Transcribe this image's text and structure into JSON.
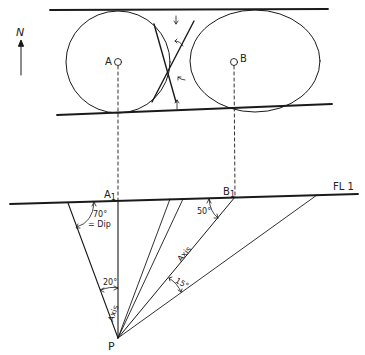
{
  "diagram": {
    "type": "structural-geology-fold-construction",
    "north_label": "N",
    "points": {
      "A": "A",
      "B": "B",
      "A1": "A",
      "A1_sub": "1",
      "B1": "B",
      "B1_sub": "1",
      "P": "P"
    },
    "fold_line_label": "FL 1",
    "angles": {
      "dip": "70°",
      "dip_label": "= Dip",
      "b_angle": "50°",
      "a_axis": "20°",
      "b_axis": "15°"
    },
    "axis_labels": {
      "left": "Axis",
      "right": "Axis"
    },
    "colors": {
      "stroke": "#1a1a1a",
      "background": "#ffffff"
    }
  }
}
